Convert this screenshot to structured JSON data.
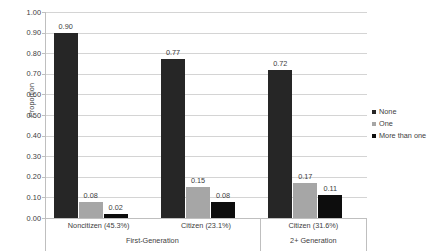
{
  "chart_data": {
    "type": "bar",
    "title": "",
    "subtitle": "",
    "xlabel": "",
    "ylabel": "Proportion",
    "ylim": [
      0.0,
      1.0
    ],
    "ystep": 0.1,
    "grid": true,
    "legend_position": "right",
    "ytick_labels": [
      "1.00",
      "0.90",
      "0.80",
      "0.70",
      "0.60",
      "0.50",
      "0.40",
      "0.30",
      "0.20",
      "0.10",
      "0.00"
    ],
    "categories": [
      "Noncitizen (45.3%)",
      "Citizen (23.1%)",
      "Citizen (31.6%)"
    ],
    "groups": [
      {
        "label": "First-Generation",
        "category_indices": [
          0,
          1
        ]
      },
      {
        "label": "2+ Generation",
        "category_indices": [
          2
        ]
      }
    ],
    "series": [
      {
        "name": "None",
        "color": "#262626",
        "values": [
          0.9,
          0.77,
          0.72
        ],
        "labels": [
          "0.90",
          "0.77",
          "0.72"
        ]
      },
      {
        "name": "One",
        "color": "#a6a6a6",
        "values": [
          0.08,
          0.15,
          0.17
        ],
        "labels": [
          "0.08",
          "0.15",
          "0.17"
        ]
      },
      {
        "name": "More than one",
        "color": "#0d0d0d",
        "values": [
          0.02,
          0.08,
          0.11
        ],
        "labels": [
          "0.02",
          "0.08",
          "0.11"
        ]
      }
    ],
    "legend": [
      {
        "label": "None",
        "color": "#262626"
      },
      {
        "label": "One",
        "color": "#a6a6a6"
      },
      {
        "label": "More than one",
        "color": "#0d0d0d"
      }
    ]
  }
}
